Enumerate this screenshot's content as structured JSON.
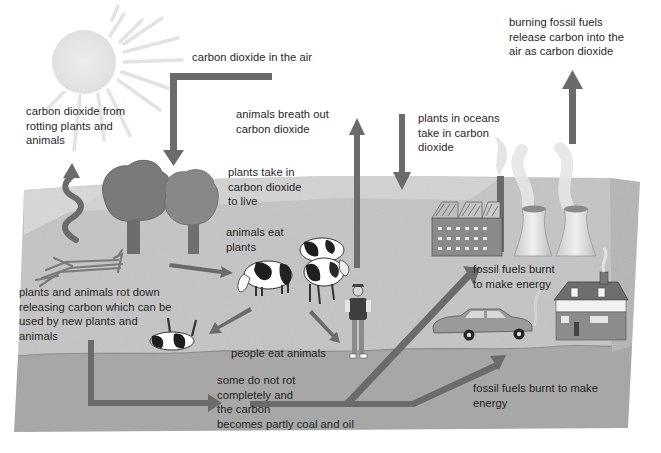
{
  "diagram": {
    "colors": {
      "background": "#ffffff",
      "ground_top": "#c7c7c7",
      "ground_far": "#d6d6d6",
      "underground": "#a9a9a9",
      "arrow": "#6b6b6b",
      "text": "#1f1f1f",
      "sun": "#e6e6e6"
    },
    "labels": {
      "co2_air": "carbon dioxide in the air",
      "co2_rotting": "carbon dioxide from\nrotting plants and\nanimals",
      "animals_breath": "animals breath out\ncarbon dioxide",
      "plants_oceans": "plants in oceans\ntake in carbon\ndioxide",
      "burning_fossil": "burning fossil fuels\nrelease carbon into the\nair as carbon dioxide",
      "plants_take_in": "plants take in\ncarbon dioxide\nto live",
      "animals_eat": "animals eat\nplants",
      "rot_down": "plants and animals rot down\nreleasing carbon which can be\nused by new plants and\nanimals",
      "people_eat": "people eat animals",
      "fossil_burnt_upper": "fossil fuels burnt\nto make energy",
      "some_do_not_rot": "some do not rot\ncompletely and\nthe carbon\nbecomes partly coal and oil",
      "fossil_burnt_lower": "fossil fuels burnt to make\nenergy"
    },
    "illustrations": [
      "sun",
      "trees",
      "fallen-log",
      "cows",
      "dead-cow",
      "person",
      "factory",
      "cooling-towers",
      "car",
      "house",
      "wavy-arrow"
    ]
  }
}
